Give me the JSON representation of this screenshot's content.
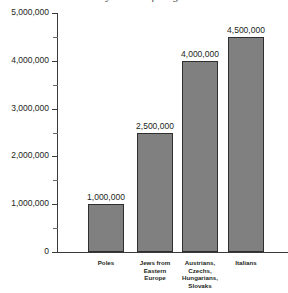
{
  "chart_data": {
    "type": "bar",
    "title": "by Nation of Origin",
    "xlabel": "",
    "ylabel": "",
    "categories": [
      "Poles",
      "Jews from Eastern Europe",
      "Austrians, Czechs, Hungarians, Slovaks",
      "Italians"
    ],
    "category_lines": [
      [
        "Poles"
      ],
      [
        "Jews from",
        "Eastern",
        "Europe"
      ],
      [
        "Austrians,",
        "Czechs,",
        "Hungarians,",
        "Slovaks"
      ],
      [
        "Italians"
      ]
    ],
    "values": [
      1000000,
      2500000,
      4000000,
      4500000
    ],
    "value_labels": [
      "1,000,000",
      "2,500,000",
      "4,000,000",
      "4,500,000"
    ],
    "ylim": [
      0,
      5000000
    ],
    "y_major_ticks": [
      0,
      1000000,
      2000000,
      3000000,
      4000000,
      5000000
    ],
    "y_tick_labels": [
      "0",
      "1,000,000",
      "2,000,000",
      "3,000,000",
      "4,000,000",
      "5,000,000"
    ],
    "y_minor_ticks": [
      500000,
      1500000,
      2500000,
      3500000,
      4500000
    ],
    "grid": false,
    "legend": null,
    "colors": {
      "bar_fill": "#808080",
      "bar_border": "#2f2f2f",
      "axis": "#3a3a3a",
      "text": "#231f20",
      "background": "#ffffff"
    }
  }
}
